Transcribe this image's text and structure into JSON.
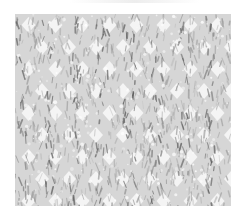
{
  "image": {
    "subject": "knitted fabric swatch",
    "pattern": "houndstooth knit texture",
    "palette": {
      "background": "#ffffff",
      "yarn_dark": "#5a5a5a",
      "yarn_mid": "#9a9a9a",
      "yarn_light": "#d6d6d6",
      "gap": "#f4f4f4"
    }
  }
}
